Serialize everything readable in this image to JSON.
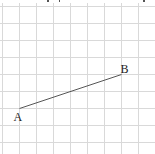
{
  "diagram": {
    "grid": {
      "columns": 9,
      "rows": 9,
      "line_color": "#d9d9d9"
    },
    "points": [
      {
        "label": "A",
        "grid_x": 1,
        "grid_y": 6
      },
      {
        "label": "B",
        "grid_x": 7,
        "grid_y": 4
      }
    ],
    "segments": [
      {
        "from": "A",
        "to": "B",
        "color": "#555555"
      }
    ]
  }
}
